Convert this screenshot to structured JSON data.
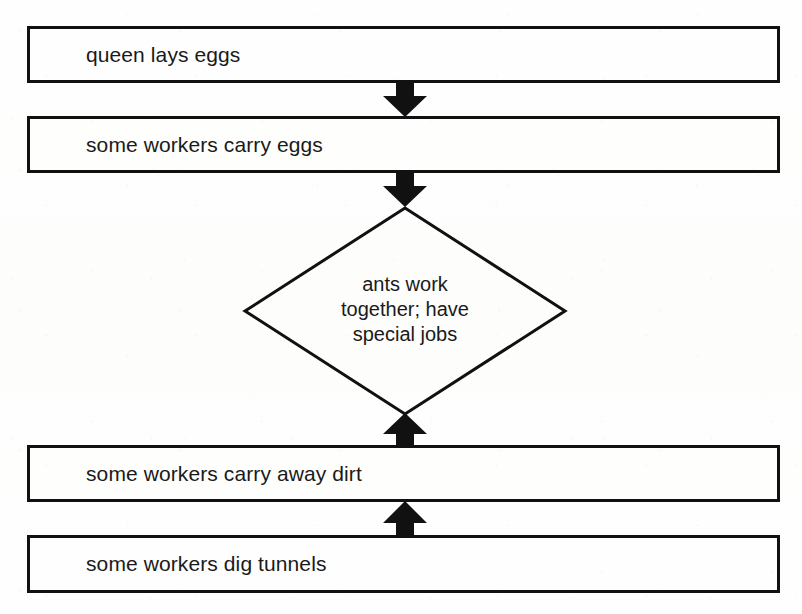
{
  "page": {
    "width": 802,
    "height": 614,
    "background_color": "#fefefe",
    "ink_color": "#111111"
  },
  "diagram": {
    "type": "flowchart",
    "nodes": [
      {
        "id": "queen-lays-eggs",
        "shape": "rectangle",
        "label": "queen lays eggs",
        "x": 27,
        "y": 26,
        "width": 753,
        "height": 57
      },
      {
        "id": "some-workers-carry-eggs",
        "shape": "rectangle",
        "label": "some workers carry eggs",
        "x": 27,
        "y": 116,
        "width": 753,
        "height": 57
      },
      {
        "id": "ants-work-together",
        "shape": "diamond",
        "label": "ants work together; have special jobs",
        "label_lines": [
          "ants work",
          "together; have",
          "special jobs"
        ],
        "center_x": 405,
        "center_y": 311,
        "half_width": 163,
        "half_height": 106
      },
      {
        "id": "some-workers-carry-away-dirt",
        "shape": "rectangle",
        "label": "some workers carry away dirt",
        "x": 27,
        "y": 445,
        "width": 753,
        "height": 57
      },
      {
        "id": "some-workers-dig-tunnels",
        "shape": "rectangle",
        "label": "some workers dig tunnels",
        "x": 27,
        "y": 535,
        "width": 753,
        "height": 58
      }
    ],
    "connectors": [
      {
        "id": "arrow-queen-to-carry-eggs",
        "from": "queen-lays-eggs",
        "to": "some-workers-carry-eggs",
        "direction": "down",
        "x": 381,
        "y": 82,
        "width": 48,
        "height": 36
      },
      {
        "id": "arrow-carry-eggs-to-diamond",
        "from": "some-workers-carry-eggs",
        "to": "ants-work-together",
        "direction": "down",
        "x": 381,
        "y": 172,
        "width": 48,
        "height": 36
      },
      {
        "id": "arrow-carry-away-dirt-to-diamond",
        "from": "some-workers-carry-away-dirt",
        "to": "ants-work-together",
        "direction": "up",
        "x": 381,
        "y": 412,
        "width": 48,
        "height": 36
      },
      {
        "id": "arrow-dig-tunnels-to-carry-away-dirt",
        "from": "some-workers-dig-tunnels",
        "to": "some-workers-carry-away-dirt",
        "direction": "up",
        "x": 381,
        "y": 500,
        "width": 48,
        "height": 38
      }
    ]
  }
}
